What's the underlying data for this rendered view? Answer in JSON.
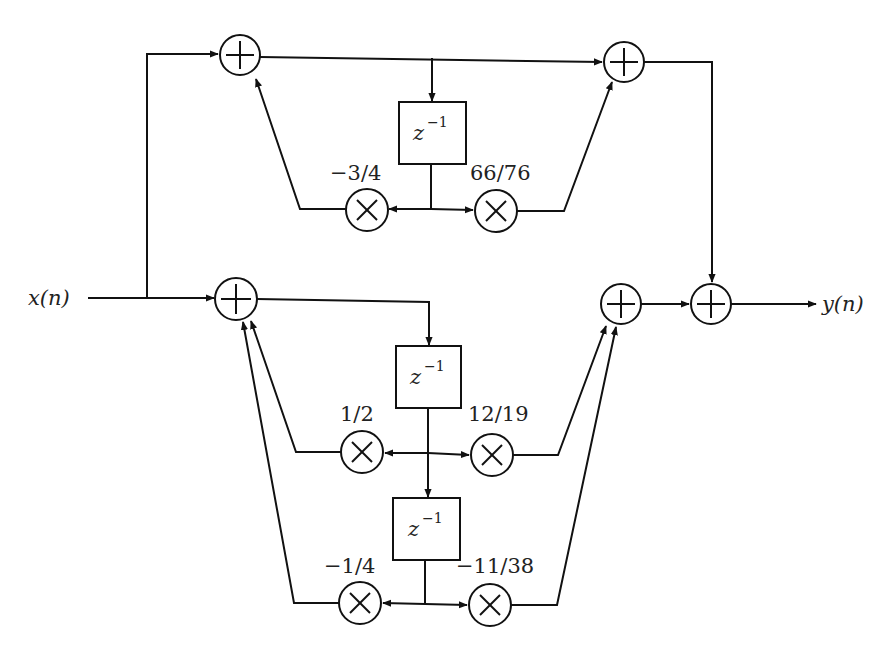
{
  "diagram": {
    "type": "signal-flow block diagram (parallel IIR filter sections)",
    "input_label": "x(n)",
    "output_label": "y(n)",
    "delay_label_base": "z",
    "delay_label_exp": "−1",
    "sections": [
      {
        "name": "first-order section",
        "delays": 1,
        "feedback_coeffs": [
          "−3/4"
        ],
        "feedforward_coeffs": [
          "66/76"
        ]
      },
      {
        "name": "second-order section",
        "delays": 2,
        "feedback_coeffs": [
          "1/2",
          "−1/4"
        ],
        "feedforward_coeffs": [
          "12/19",
          "−11/38"
        ]
      }
    ],
    "coefficients": {
      "top_left": "−3/4",
      "top_right": "66/76",
      "mid_left": "1/2",
      "mid_right": "12/19",
      "bot_left": "−1/4",
      "bot_right": "−11/38"
    },
    "adder_symbol": "+",
    "multiplier_symbol": "×"
  }
}
